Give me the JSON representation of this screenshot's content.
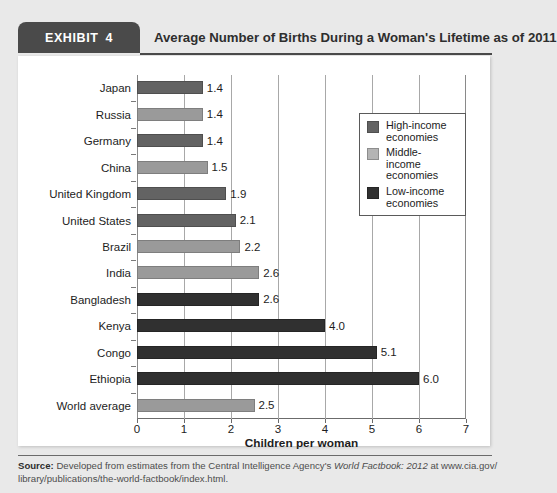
{
  "exhibit": {
    "badge_label": "EXHIBIT",
    "badge_number": "4",
    "title": "Average Number of Births During a Woman's Lifetime as of 2011"
  },
  "legend": {
    "items": [
      {
        "label": "High-income\neconomies",
        "class": "high",
        "color": "#636363"
      },
      {
        "label": "Middle-income\neconomies",
        "class": "middle",
        "color": "#b4b4b4"
      },
      {
        "label": "Low-income\neconomies",
        "class": "low",
        "color": "#303030"
      }
    ]
  },
  "source": {
    "prefix": "Source:",
    "line1_a": " Developed from estimates from the Central Intelligence Agency's ",
    "line1_italic": "World Factbook: 2012",
    "line1_b": " at www.cia.gov/",
    "line2": "library/publications/the-world-factbook/index.html."
  },
  "chart_data": {
    "type": "bar",
    "orientation": "horizontal",
    "title": "Average Number of Births During a Woman's Lifetime as of 2011",
    "xlabel": "Children per woman",
    "ylabel": "",
    "xlim": [
      0,
      7
    ],
    "xticks": [
      0,
      1,
      2,
      3,
      4,
      5,
      6,
      7
    ],
    "grid": "vertical",
    "legend_position": "upper-right-inside",
    "categories": [
      "Japan",
      "Russia",
      "Germany",
      "China",
      "United Kingdom",
      "United States",
      "Brazil",
      "India",
      "Bangladesh",
      "Kenya",
      "Congo",
      "Ethiopia",
      "World average"
    ],
    "values": [
      1.4,
      1.4,
      1.4,
      1.5,
      1.9,
      2.1,
      2.2,
      2.6,
      2.6,
      4.0,
      5.1,
      6.0,
      2.5
    ],
    "value_labels": [
      "1.4",
      "1.4",
      "1.4",
      "1.5",
      "1.9",
      "2.1",
      "2.2",
      "2.6",
      "2.6",
      "4.0",
      "5.1",
      "6.0",
      "2.5"
    ],
    "groups": [
      "high",
      "middle",
      "high",
      "middle",
      "high",
      "high",
      "middle",
      "middle",
      "low",
      "low",
      "low",
      "low",
      "middle"
    ],
    "group_names": {
      "high": "High-income economies",
      "middle": "Middle-income economies",
      "low": "Low-income economies"
    }
  }
}
